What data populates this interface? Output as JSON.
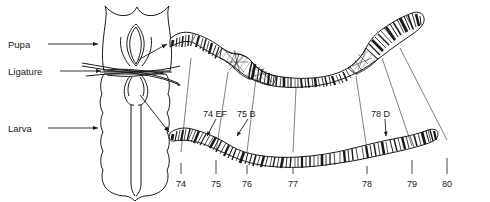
{
  "figure": {
    "ink_color": "#1a1a1a",
    "background": "#ffffff"
  },
  "organism_labels": [
    {
      "id": "pupa",
      "text": "Pupa",
      "x": 8,
      "y": 40,
      "arrow_from_x": 48,
      "arrow_from_y": 44,
      "arrow_to_x": 100,
      "arrow_to_y": 44
    },
    {
      "id": "ligature",
      "text": "Ligature",
      "x": 8,
      "y": 67,
      "arrow_from_x": 60,
      "arrow_from_y": 71,
      "arrow_to_x": 104,
      "arrow_to_y": 71
    },
    {
      "id": "larva",
      "text": "Larva",
      "x": 8,
      "y": 124,
      "arrow_from_x": 48,
      "arrow_from_y": 128,
      "arrow_to_x": 100,
      "arrow_to_y": 128
    }
  ],
  "puff_labels": [
    {
      "id": "puff-74ef",
      "text": "74 EF",
      "x": 203,
      "y": 110,
      "arrow_from_x": 216,
      "arrow_from_y": 119,
      "arrow_to_x": 206,
      "arrow_to_y": 137
    },
    {
      "id": "puff-75b",
      "text": "75 B",
      "x": 237,
      "y": 110,
      "arrow_from_x": 248,
      "arrow_from_y": 119,
      "arrow_to_x": 236,
      "arrow_to_y": 137
    },
    {
      "id": "puff-78d",
      "text": "78 D",
      "x": 371,
      "y": 110,
      "arrow_from_x": 385,
      "arrow_from_y": 119,
      "arrow_to_x": 386,
      "arrow_to_y": 137
    }
  ],
  "chromosome_divisions": [
    {
      "label": "74",
      "x": 181,
      "tick_top": 163,
      "tick_bottom": 174,
      "text_y": 180
    },
    {
      "label": "75",
      "x": 216,
      "tick_top": 160,
      "tick_bottom": 174,
      "text_y": 180
    },
    {
      "label": "76",
      "x": 247,
      "tick_top": 165,
      "tick_bottom": 174,
      "text_y": 180
    },
    {
      "label": "77",
      "x": 293,
      "tick_top": 168,
      "tick_bottom": 174,
      "text_y": 180
    },
    {
      "label": "78",
      "x": 367,
      "tick_top": 166,
      "tick_bottom": 174,
      "text_y": 180
    },
    {
      "label": "79",
      "x": 412,
      "tick_top": 160,
      "tick_bottom": 174,
      "text_y": 180
    },
    {
      "label": "80",
      "x": 447,
      "tick_top": 158,
      "tick_bottom": 174,
      "text_y": 180
    }
  ],
  "pointer_arrows": [
    {
      "id": "pupa-gland-to-chromosome",
      "from_x": 138,
      "from_y": 60,
      "to_x": 168,
      "to_y": 43
    },
    {
      "id": "larva-gland-to-chromosome",
      "from_x": 140,
      "from_y": 95,
      "to_x": 170,
      "to_y": 133
    }
  ],
  "chromosomes": [
    {
      "id": "pupal-chromosome",
      "state": "pupa",
      "description": "Salivary gland polytene chromosome arm 3L from ligatured anterior (pupal) half, showing expanded ecdysone-induced puffs",
      "puffs_present": [
        "74 EF",
        "75 B",
        "78 D"
      ]
    },
    {
      "id": "larval-chromosome",
      "state": "larva",
      "description": "Salivary gland polytene chromosome arm 3L from ligatured posterior (larval) half, puffs not induced",
      "puffs_present": []
    }
  ],
  "correspondence_lines": [
    {
      "from_x": 191,
      "from_y": 58,
      "to_x": 181,
      "to_y": 152
    },
    {
      "from_x": 228,
      "from_y": 72,
      "to_x": 216,
      "to_y": 152
    },
    {
      "from_x": 256,
      "from_y": 78,
      "to_x": 247,
      "to_y": 152
    },
    {
      "from_x": 296,
      "from_y": 80,
      "to_x": 293,
      "to_y": 152
    },
    {
      "from_x": 356,
      "from_y": 76,
      "to_x": 367,
      "to_y": 150
    },
    {
      "from_x": 382,
      "from_y": 58,
      "to_x": 412,
      "to_y": 146
    },
    {
      "from_x": 400,
      "from_y": 48,
      "to_x": 447,
      "to_y": 140
    }
  ]
}
